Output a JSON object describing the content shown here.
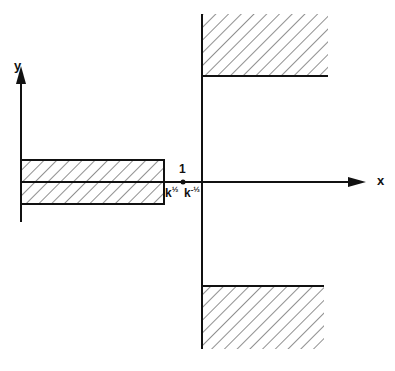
{
  "diagram": {
    "axes": {
      "x_label": "x",
      "y_label": "y"
    },
    "ticks": {
      "point_label": "1",
      "k_half_base": "k",
      "k_half_exp": "½",
      "k_neg_half_base": "k",
      "k_neg_half_exp": "-½"
    },
    "regions": [
      {
        "name": "left-strip",
        "description": "hatched rectangle along negative x-axis, symmetric about x-axis, ending at k^1/2"
      },
      {
        "name": "upper-region",
        "description": "hatched region right of x = k^-1/2, above a horizontal boundary"
      },
      {
        "name": "lower-region",
        "description": "hatched region right of x = k^-1/2, below a horizontal boundary"
      }
    ],
    "colors": {
      "ink": "#111111",
      "background": "#ffffff"
    }
  }
}
